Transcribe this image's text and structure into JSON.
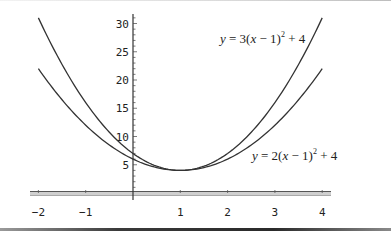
{
  "chart_data": {
    "type": "line",
    "title": "",
    "xlabel": "",
    "ylabel": "",
    "xlim": [
      -2,
      4
    ],
    "ylim": [
      0,
      31
    ],
    "grid": false,
    "x_ticks": [
      -2,
      -1,
      1,
      2,
      3,
      4
    ],
    "x_tick_labels": [
      "-2",
      "-1",
      "1",
      "2",
      "3",
      "4"
    ],
    "y_ticks": [
      5,
      10,
      15,
      20,
      25,
      30
    ],
    "y_tick_labels": [
      "5",
      "10",
      "15",
      "20",
      "25",
      "30"
    ],
    "series": [
      {
        "name": "y = 3(x - 1)^2 + 4",
        "formula": "3*(x-1)^2+4",
        "x": [
          -2,
          -1,
          0,
          1,
          2,
          3,
          4
        ],
        "values": [
          31,
          16,
          7,
          4,
          7,
          16,
          31
        ]
      },
      {
        "name": "y = 2(x - 1)^2 + 4",
        "formula": "2*(x-1)^2+4",
        "x": [
          -2,
          -1,
          0,
          1,
          2,
          3,
          4
        ],
        "values": [
          22,
          12,
          6,
          4,
          6,
          12,
          22
        ]
      }
    ],
    "annotations": [
      {
        "text": "y = 3(x − 1)² + 4",
        "near": "upper curve, top right"
      },
      {
        "text": "y = 2(x − 1)² + 4",
        "near": "lower curve, lower right"
      }
    ],
    "legend": "inline annotations"
  },
  "labels": {
    "eq1": {
      "lhs": "y",
      "mid": " = 3(",
      "x": "x",
      "rest": " − 1)",
      "exp": "2",
      "tail": " + 4"
    },
    "eq2": {
      "lhs": "y",
      "mid": " = 2(",
      "x": "x",
      "rest": " − 1)",
      "exp": "2",
      "tail": " + 4"
    }
  },
  "style": {
    "line_color": "#333333",
    "axis_color": "#444444"
  }
}
